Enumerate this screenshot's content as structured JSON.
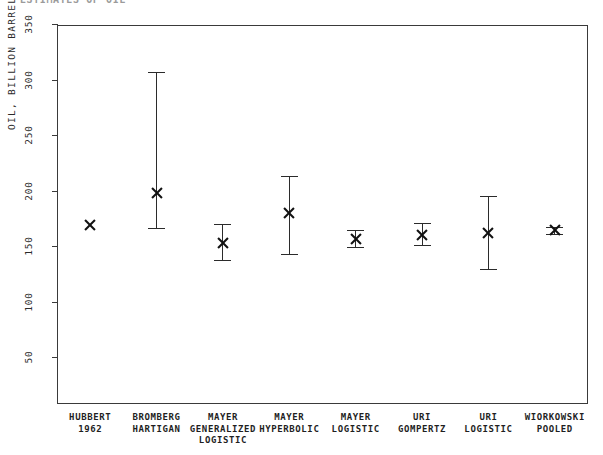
{
  "chart_data": {
    "type": "scatter",
    "title": "ESTIMATES OF OIL",
    "xlabel": "",
    "ylabel": "OIL, BILLION BARRELS",
    "ylim": [
      0,
      350
    ],
    "yticks": [
      50,
      100,
      150,
      200,
      250,
      300,
      350
    ],
    "grid": false,
    "legend": "none",
    "marker_style": "star",
    "categories": [
      "HUBBERT 1962",
      "BROMBERG HARTIGAN",
      "MAYER GENERALIZED LOGISTIC",
      "MAYER HYPERBOLIC",
      "MAYER LOGISTIC",
      "URI GOMPERTZ",
      "URI LOGISTIC",
      "WIORKOWSKI POOLED"
    ],
    "values": [
      170,
      199,
      154,
      181,
      157,
      161,
      163,
      165
    ],
    "error_low": [
      170,
      167,
      138,
      144,
      150,
      152,
      130,
      162
    ],
    "error_high": [
      170,
      308,
      171,
      214,
      165,
      172,
      196,
      168
    ],
    "points": [
      {
        "label": "HUBBERT 1962",
        "value": 170,
        "low": 170,
        "high": 170,
        "has_error_bar": false
      },
      {
        "label": "BROMBERG HARTIGAN",
        "value": 199,
        "low": 167,
        "high": 308,
        "has_error_bar": true
      },
      {
        "label": "MAYER GENERALIZED LOGISTIC",
        "value": 154,
        "low": 138,
        "high": 171,
        "has_error_bar": true
      },
      {
        "label": "MAYER HYPERBOLIC",
        "value": 181,
        "low": 144,
        "high": 214,
        "has_error_bar": true
      },
      {
        "label": "MAYER LOGISTIC",
        "value": 157,
        "low": 150,
        "high": 165,
        "has_error_bar": true
      },
      {
        "label": "URI GOMPERTZ",
        "value": 161,
        "low": 152,
        "high": 172,
        "has_error_bar": true
      },
      {
        "label": "URI LOGISTIC",
        "value": 163,
        "low": 130,
        "high": 196,
        "has_error_bar": true
      },
      {
        "label": "WIORKOWSKI POOLED",
        "value": 165,
        "low": 162,
        "high": 168,
        "has_error_bar": true
      }
    ]
  },
  "axis": {
    "y_title": "OIL, BILLION BARRELS",
    "tick_labels": [
      "350",
      "300",
      "250",
      "200",
      "150",
      "100",
      "50"
    ]
  },
  "x_axis_labels": [
    {
      "lines": [
        "HUBBERT",
        "1962"
      ]
    },
    {
      "lines": [
        "BROMBERG",
        "HARTIGAN"
      ]
    },
    {
      "lines": [
        "MAYER",
        "GENERALIZED",
        "LOGISTIC"
      ]
    },
    {
      "lines": [
        "MAYER",
        "HYPERBOLIC"
      ]
    },
    {
      "lines": [
        "MAYER",
        "LOGISTIC"
      ]
    },
    {
      "lines": [
        "URI",
        "GOMPERTZ"
      ]
    },
    {
      "lines": [
        "URI",
        "LOGISTIC"
      ]
    },
    {
      "lines": [
        "WIORKOWSKI",
        "POOLED"
      ]
    }
  ],
  "header": {
    "clipped_title": "ESTIMATES OF OIL"
  },
  "colors": {
    "axis": "#3a3a3a",
    "marker": "#111111",
    "error_bar": "#2b2b2b",
    "background": "#ffffff",
    "text": "#1f1f1f"
  }
}
